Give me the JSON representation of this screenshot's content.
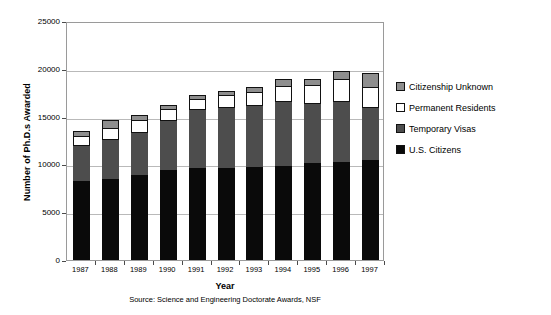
{
  "chart_data": {
    "type": "bar",
    "subtype": "stacked",
    "title": "",
    "xlabel": "Year",
    "ylabel": "Number of Ph.D.s Awarded",
    "source_note": "Source: Science and Engineering Doctorate Awards, NSF",
    "ylim": [
      0,
      25000
    ],
    "ytick_labels": [
      "25000",
      "20000",
      "15000",
      "10000",
      "5000",
      "0"
    ],
    "ytick_values": [
      25000,
      20000,
      15000,
      10000,
      5000,
      0
    ],
    "grid": true,
    "legend_position": "right",
    "categories": [
      "1987",
      "1988",
      "1989",
      "1990",
      "1991",
      "1992",
      "1993",
      "1994",
      "1995",
      "1996",
      "1997"
    ],
    "series": [
      {
        "name": "U.S. Citizens",
        "color": "#0a0a0a",
        "values": [
          8300,
          8500,
          8900,
          9400,
          9600,
          9650,
          9700,
          9850,
          10100,
          10250,
          10450
        ]
      },
      {
        "name": "Temporary Visas",
        "color": "#4d4d4d",
        "values": [
          3750,
          4200,
          4450,
          5250,
          6200,
          6400,
          6550,
          6750,
          6300,
          6350,
          5600
        ]
      },
      {
        "name": "Permanent Residents",
        "color": "#ffffff",
        "values": [
          950,
          1150,
          1300,
          1100,
          1050,
          1200,
          1300,
          1600,
          1900,
          2350,
          2100
        ]
      },
      {
        "name": "Citizenship Unknown",
        "color": "#8e8e8e",
        "values": [
          500,
          750,
          500,
          500,
          400,
          450,
          500,
          700,
          650,
          850,
          1450
        ]
      }
    ],
    "totals": [
      13500,
      14600,
      15150,
      16250,
      17250,
      17700,
      18050,
      18900,
      18950,
      19800,
      19600
    ]
  },
  "legend": {
    "entries": [
      {
        "label": "Citizenship Unknown",
        "swatch": "unknown"
      },
      {
        "label": "Permanent Residents",
        "swatch": "permanent"
      },
      {
        "label": "Temporary Visas",
        "swatch": "temporary"
      },
      {
        "label": "U.S. Citizens",
        "swatch": "citizens"
      }
    ]
  }
}
